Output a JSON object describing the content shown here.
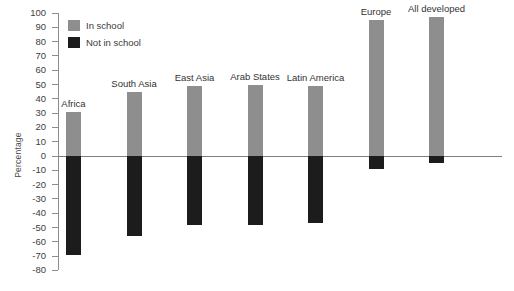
{
  "chart_data": {
    "type": "bar",
    "title": "",
    "xlabel": "",
    "ylabel": "Percentage",
    "ylim": [
      -80,
      100
    ],
    "ytick_step": 10,
    "grid": false,
    "legend_position": "top-left",
    "orientation": "vertical",
    "stacked": false,
    "categories": [
      "Africa",
      "South Asia",
      "East Asia",
      "Arab States",
      "Latin America",
      "Europe",
      "All developed"
    ],
    "yticks": [
      "100",
      "90",
      "80",
      "70",
      "60",
      "50",
      "40",
      "30",
      "20",
      "10",
      "0",
      "-10",
      "-20",
      "-30",
      "-40",
      "-50",
      "-60",
      "-70",
      "-80"
    ],
    "series": [
      {
        "name": "In school",
        "color": "#8e8e8e",
        "values": [
          31,
          45,
          49,
          50,
          49,
          95,
          97
        ]
      },
      {
        "name": "Not in school",
        "color": "#1c1c1c",
        "values": [
          -69,
          -56,
          -48,
          -48,
          -47,
          -9,
          -5
        ]
      }
    ],
    "legend": [
      {
        "label": "In school",
        "color": "#8e8e8e"
      },
      {
        "label": "Not in school",
        "color": "#1c1c1c"
      }
    ]
  },
  "colors": {
    "in_school": "#8e8e8e",
    "not_in_school": "#1c1c1c",
    "axis": "#8c8c8c",
    "background": "#ffffff",
    "text": "#333333"
  }
}
